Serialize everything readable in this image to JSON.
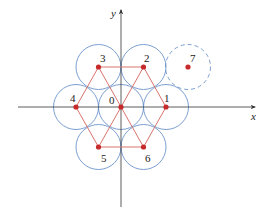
{
  "diagram": {
    "axes": {
      "x_label": "x",
      "y_label": "y",
      "origin": [
        121,
        107
      ],
      "x_range": [
        18,
        255
      ],
      "y_range": [
        10,
        207
      ],
      "color": "#333333"
    },
    "circle_radius": 22.5,
    "colors": {
      "circle": "#5a86c4",
      "point": "#c62a2a",
      "line": "#d9746e"
    },
    "points": [
      {
        "id": "0",
        "label": "0",
        "x": 121,
        "y": 107,
        "lx": 109,
        "ly": 104,
        "dashed": false
      },
      {
        "id": "1",
        "label": "1",
        "x": 166,
        "y": 107,
        "lx": 164,
        "ly": 102,
        "dashed": false
      },
      {
        "id": "2",
        "label": "2",
        "x": 143.5,
        "y": 67,
        "lx": 144,
        "ly": 62,
        "dashed": false
      },
      {
        "id": "3",
        "label": "3",
        "x": 98.5,
        "y": 67,
        "lx": 100,
        "ly": 62,
        "dashed": false
      },
      {
        "id": "4",
        "label": "4",
        "x": 76,
        "y": 107,
        "lx": 70,
        "ly": 102,
        "dashed": false
      },
      {
        "id": "5",
        "label": "5",
        "x": 98.5,
        "y": 147,
        "lx": 101,
        "ly": 162,
        "dashed": false
      },
      {
        "id": "6",
        "label": "6",
        "x": 143.5,
        "y": 147,
        "lx": 145,
        "ly": 162,
        "dashed": false
      },
      {
        "id": "7",
        "label": "7",
        "x": 188,
        "y": 67,
        "lx": 190,
        "ly": 62,
        "dashed": true
      }
    ],
    "edges": [
      [
        "3",
        "2"
      ],
      [
        "2",
        "1"
      ],
      [
        "1",
        "6"
      ],
      [
        "6",
        "5"
      ],
      [
        "5",
        "4"
      ],
      [
        "4",
        "3"
      ],
      [
        "3",
        "6"
      ],
      [
        "2",
        "5"
      ]
    ]
  }
}
